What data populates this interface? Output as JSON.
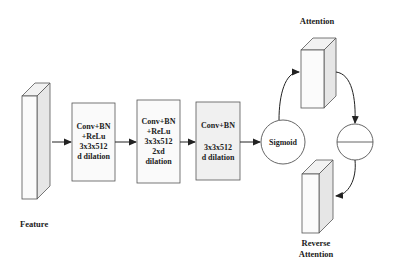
{
  "labels": {
    "feature": "Feature",
    "attention": "Attention",
    "reverse_attention_line1": "Reverse",
    "reverse_attention_line2": "Attention",
    "sigmoid": "Sigmoid"
  },
  "blocks": [
    {
      "lines": [
        "Conv+BN",
        "+ReLu",
        "3x3x512",
        "d dilation"
      ]
    },
    {
      "lines": [
        "Conv+BN",
        "+ReLu",
        "3x3x512",
        "2xd",
        "dilation"
      ]
    },
    {
      "lines": [
        "Conv+BN",
        "",
        "3x3x512",
        "d dilation"
      ]
    }
  ],
  "operators": {
    "subtract_symbol": "subtract"
  },
  "colors": {
    "stroke": "#444444",
    "box_fill": "#fafafa",
    "box3_fill": "#f0f0f0",
    "block_front": "#fbfbfb",
    "block_side": "#e8e8e8",
    "block_top": "#f2f2f2"
  }
}
